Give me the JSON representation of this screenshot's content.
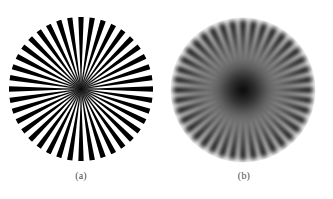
{
  "page": {
    "background_color": "#ffffff",
    "width": 333,
    "height": 199,
    "kind": "figure-pair"
  },
  "figures": [
    {
      "id": "a",
      "caption": "(a)",
      "label": "siemens-star-sharp",
      "description": "Radial spoke (Siemens star) resolution test pattern, sharp original",
      "center_x": 80,
      "center_y": 88,
      "radius": 72,
      "spokes": 40,
      "spoke_color": "#000000",
      "gap_color": "#ffffff",
      "blur_px": 0.6,
      "core_radius": 9,
      "spoke_duty": 0.47
    },
    {
      "id": "b",
      "caption": "(b)",
      "label": "siemens-star-blurred",
      "description": "Same Siemens star pattern after blurring / dilation degradation",
      "center_x": 242,
      "center_y": 89,
      "radius": 70,
      "spokes": 40,
      "spoke_color": "#000000",
      "gap_color": "#ffffff",
      "blur_px": 2.4,
      "core_radius": 16,
      "spoke_duty": 0.62
    }
  ],
  "colors": {
    "background": "#ffffff",
    "ink": "#000000",
    "caption_text": "#4a4a4a"
  }
}
